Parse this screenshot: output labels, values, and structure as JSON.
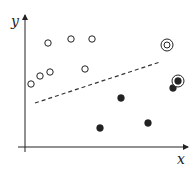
{
  "chart_data": {
    "type": "scatter",
    "title": "",
    "xlabel": "x",
    "ylabel": "y",
    "grid": false,
    "legend": null,
    "ticks": "none",
    "coordinate_note": "plot units = pixels from axis origin (no tick labels shown)",
    "origin_px": [
      25,
      147
    ],
    "axes": {
      "x_end": 163,
      "y_end": 132
    },
    "series": [
      {
        "name": "class-positive (open circles)",
        "marker": "open-circle",
        "points": [
          [
            6,
            63
          ],
          [
            15,
            71
          ],
          [
            25,
            75
          ],
          [
            23,
            104
          ],
          [
            46,
            108
          ],
          [
            67,
            108
          ],
          [
            60,
            78
          ]
        ]
      },
      {
        "name": "class-positive highlighted (double circle)",
        "marker": "double-open-circle",
        "points": [
          [
            142,
            102
          ]
        ]
      },
      {
        "name": "class-negative (filled circles)",
        "marker": "filled-circle",
        "points": [
          [
            96,
            49
          ],
          [
            75,
            19
          ],
          [
            123,
            24
          ],
          [
            148,
            59
          ]
        ]
      },
      {
        "name": "class-negative highlighted (ringed filled circle)",
        "marker": "ringed-filled-circle",
        "points": [
          [
            153,
            66
          ]
        ]
      }
    ],
    "decision_boundary": {
      "style": "dashed",
      "from": [
        10,
        44
      ],
      "to": [
        135,
        85
      ]
    }
  },
  "labels": {
    "x": "x",
    "y": "y"
  },
  "colors": {
    "ink": "#222222",
    "background": "#ffffff"
  }
}
